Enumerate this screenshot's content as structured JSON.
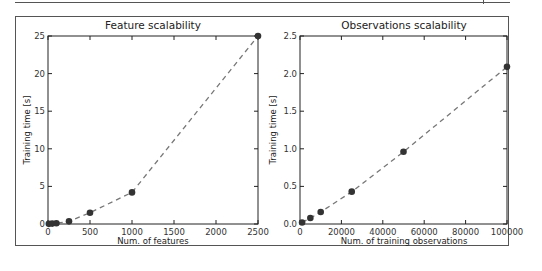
{
  "chart_data": [
    {
      "type": "line",
      "title": "Feature scalability",
      "xlabel": "Num. of features",
      "ylabel": "Training time [s]",
      "xlim": [
        0,
        2500
      ],
      "ylim": [
        0,
        25
      ],
      "xticks": [
        "0",
        "500",
        "1000",
        "1500",
        "2000",
        "2500"
      ],
      "yticks": [
        "0",
        "5",
        "10",
        "15",
        "20",
        "25"
      ],
      "grid": false,
      "line_style": "dashed",
      "marker": "circle",
      "x": [
        10,
        50,
        100,
        250,
        500,
        1000,
        2500
      ],
      "y": [
        0.02,
        0.05,
        0.1,
        0.35,
        1.5,
        4.2,
        25.0
      ]
    },
    {
      "type": "line",
      "title": "Observations scalability",
      "xlabel": "Num. of training observations",
      "ylabel": "Training time [s]",
      "xlim": [
        0,
        100000
      ],
      "ylim": [
        0,
        2.5
      ],
      "xticks": [
        "0",
        "20000",
        "40000",
        "60000",
        "80000",
        "100000"
      ],
      "yticks": [
        "0.0",
        "0.5",
        "1.0",
        "1.5",
        "2.0",
        "2.5"
      ],
      "grid": false,
      "line_style": "dashed",
      "marker": "circle",
      "x": [
        1000,
        5000,
        10000,
        25000,
        50000,
        100000
      ],
      "y": [
        0.02,
        0.08,
        0.16,
        0.43,
        0.96,
        2.09
      ]
    }
  ],
  "colors": {
    "line": "#777777",
    "marker": "#333333",
    "axes": "#222222"
  }
}
